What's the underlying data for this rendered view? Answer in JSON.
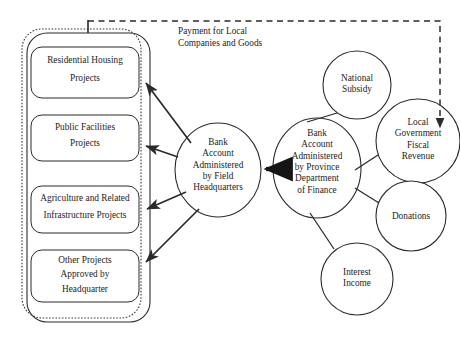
{
  "diagram": {
    "annotations": [
      {
        "id": "payment-note",
        "line1": "Payment for Local",
        "line2": "Companies and Goods"
      }
    ],
    "container": {
      "name": "field-headquarters-project-group",
      "style": "rounded-rectangle-double-border"
    },
    "project_boxes": [
      {
        "id": "residential-housing",
        "line1": "Residential Housing",
        "line2": "Projects"
      },
      {
        "id": "public-facilities",
        "line1": "Public Facilities",
        "line2": "Projects"
      },
      {
        "id": "agriculture-infrastructure",
        "line1": "Agriculture and Related",
        "line2": "Infrastructure Projects"
      },
      {
        "id": "other-projects",
        "line1": "Other Projects",
        "line2": "Approved by",
        "line3": "Headquarter"
      }
    ],
    "nodes": [
      {
        "id": "bank-account-field-headquarters",
        "lines": [
          "Bank",
          "Account",
          "Administered",
          "by Field",
          "Headquarters"
        ]
      },
      {
        "id": "bank-account-province-department-of-finance",
        "lines": [
          "Bank",
          "Account",
          "Administered",
          "by Province",
          "Department",
          "of Finance"
        ]
      },
      {
        "id": "national-subsidy",
        "lines": [
          "National",
          "Subsidy"
        ]
      },
      {
        "id": "local-government-fiscal-revenue",
        "lines": [
          "Local",
          "Government",
          "Fiscal",
          "Revenue"
        ]
      },
      {
        "id": "donations",
        "lines": [
          "Donations"
        ]
      },
      {
        "id": "interest-income",
        "lines": [
          "Interest",
          "Income"
        ]
      }
    ],
    "edges": [
      {
        "id": "province-to-field",
        "from": "bank-account-province-department-of-finance",
        "to": "bank-account-field-headquarters",
        "style": "solid-thick-arrow"
      },
      {
        "id": "field-to-residential",
        "from": "bank-account-field-headquarters",
        "to": "residential-housing",
        "style": "solid-arrow"
      },
      {
        "id": "field-to-public-facilities",
        "from": "bank-account-field-headquarters",
        "to": "public-facilities",
        "style": "solid-arrow"
      },
      {
        "id": "field-to-agriculture",
        "from": "bank-account-field-headquarters",
        "to": "agriculture-infrastructure",
        "style": "solid-arrow"
      },
      {
        "id": "field-to-other-projects",
        "from": "bank-account-field-headquarters",
        "to": "other-projects",
        "style": "solid-arrow"
      },
      {
        "id": "national-subsidy-to-province",
        "from": "national-subsidy",
        "to": "bank-account-province-department-of-finance",
        "style": "solid-line"
      },
      {
        "id": "local-revenue-to-province",
        "from": "local-government-fiscal-revenue",
        "to": "bank-account-province-department-of-finance",
        "style": "solid-line"
      },
      {
        "id": "donations-to-province",
        "from": "donations",
        "to": "bank-account-province-department-of-finance",
        "style": "solid-line"
      },
      {
        "id": "interest-income-to-province",
        "from": "interest-income",
        "to": "bank-account-province-department-of-finance",
        "style": "solid-line"
      },
      {
        "id": "projects-to-local-revenue",
        "from": "field-headquarters-project-group",
        "to": "local-government-fiscal-revenue",
        "style": "dashed-arrow",
        "label": "payment-note"
      }
    ],
    "colors": {
      "stroke": "#2b2b2b",
      "background": "#ffffff",
      "text": "#242424"
    }
  }
}
